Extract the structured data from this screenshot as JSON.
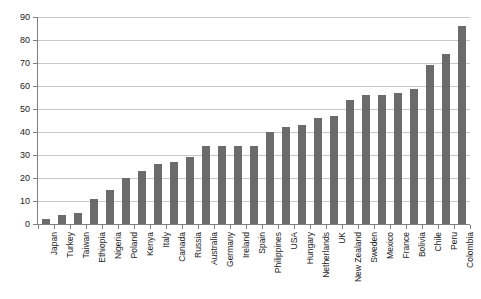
{
  "chart_data": {
    "type": "bar",
    "title": "",
    "subtitle": "",
    "xlabel": "",
    "ylabel": "",
    "ylim": [
      0,
      90
    ],
    "ytick_step": 10,
    "yticks": [
      0,
      10,
      20,
      30,
      40,
      50,
      60,
      70,
      80,
      90
    ],
    "grid": true,
    "legend": false,
    "legend_position": "none",
    "bar_color": "#6b6b6b",
    "gridline_color": "#c8c8c8",
    "axis_color": "#808080",
    "categories": [
      "Japan",
      "Turkey",
      "Taiwan",
      "Ethiopia",
      "Nigeria",
      "Poland",
      "Kenya",
      "Italy",
      "Canada",
      "Russia",
      "Australia",
      "Germany",
      "Ireland",
      "Spain",
      "Philippines",
      "USA",
      "Hungary",
      "Netherlands",
      "UK",
      "New Zealand",
      "Sweden",
      "Mexico",
      "France",
      "Bolivia",
      "Chile",
      "Peru",
      "Colombia"
    ],
    "values": [
      2,
      4,
      5,
      11,
      15,
      20,
      23,
      26,
      27,
      29,
      34,
      34,
      34,
      34,
      40,
      42,
      43,
      46,
      47,
      54,
      56,
      56,
      57,
      58.5,
      69,
      74,
      86
    ]
  }
}
